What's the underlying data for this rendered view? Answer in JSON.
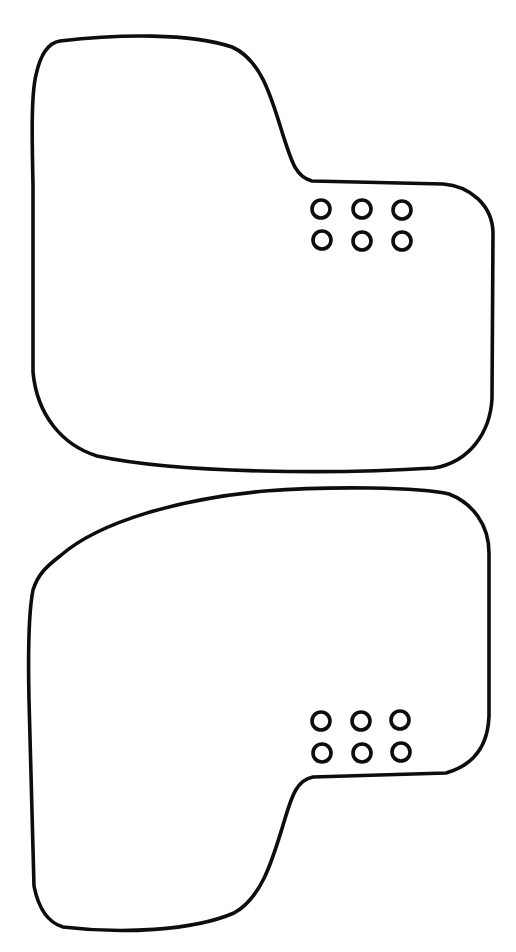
{
  "document": {
    "type": "line-art-outline-drawing",
    "title": "Two-part outline template",
    "background_color": "#ffffff",
    "stroke_color": "#0d0d0d",
    "stroke_width": 3.6,
    "canvas": {
      "width": 516,
      "height": 952
    }
  },
  "shapes": [
    {
      "id": "upper-part",
      "label": "Upper mat outline",
      "description": "Rounded quadrilateral blank with a stepped notch at upper right",
      "bounds": {
        "x": 30,
        "y": 30,
        "width": 465,
        "height": 445
      },
      "path": "M 60 41 C 120 34 190 33 232 47 C 262 60 272 100 283 135 C 292 163 296 177 312 181 L 443 184 C 470 186 492 205 493 232 L 492 399 C 490 432 470 462 434 468 C 340 474 180 474 97 456 C 62 445 37 415 33 372 L 33 185 C 32 140 31 95 36 75 C 40 56 47 43 60 41 Z",
      "holes": {
        "count": 6,
        "rows": 2,
        "columns": 3,
        "radius": 9,
        "centers": [
          {
            "cx": 321,
            "cy": 209
          },
          {
            "cx": 362,
            "cy": 209
          },
          {
            "cx": 402,
            "cy": 210
          },
          {
            "cx": 322,
            "cy": 240
          },
          {
            "cx": 362,
            "cy": 241
          },
          {
            "cx": 402,
            "cy": 241
          }
        ]
      }
    },
    {
      "id": "lower-part",
      "label": "Lower mat outline",
      "description": "Mirrored rounded quadrilateral blank with a stepped notch at lower right",
      "bounds": {
        "x": 26,
        "y": 486,
        "width": 465,
        "height": 455
      },
      "path": "M 60 556 C 100 521 180 499 265 491 C 330 486 420 487 449 494 C 472 503 489 524 489 553 L 489 716 C 488 745 474 765 446 773 L 313 777 C 297 780 292 795 284 822 C 273 858 262 898 234 913 C 192 931 120 934 63 927 C 46 922 38 906 34 886 L 29 700 C 28 655 29 610 33 590 C 38 574 47 566 60 556 Z",
      "holes": {
        "count": 6,
        "rows": 2,
        "columns": 3,
        "radius": 9,
        "centers": [
          {
            "cx": 321,
            "cy": 721
          },
          {
            "cx": 361,
            "cy": 721
          },
          {
            "cx": 400,
            "cy": 720
          },
          {
            "cx": 322,
            "cy": 753
          },
          {
            "cx": 362,
            "cy": 753
          },
          {
            "cx": 401,
            "cy": 752
          }
        ]
      }
    }
  ]
}
